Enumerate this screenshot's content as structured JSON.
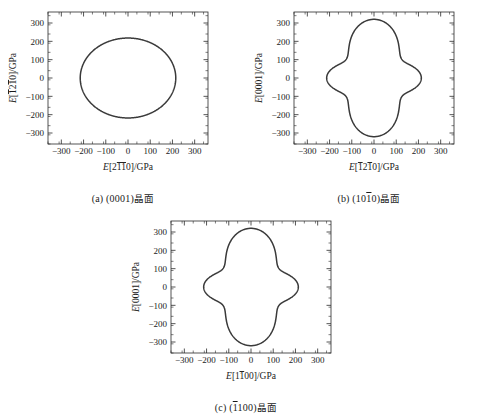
{
  "figure": {
    "panels": [
      {
        "id": "a",
        "caption_prefix": "(a) (0001)",
        "caption_suffix": "晶面",
        "xlabel_parts": [
          {
            "t": "E",
            "italic": true,
            "over": false
          },
          {
            "t": "[2",
            "italic": false,
            "over": false
          },
          {
            "t": "11",
            "italic": false,
            "over": true
          },
          {
            "t": "0]/GPa",
            "italic": false,
            "over": false
          }
        ],
        "ylabel_parts": [
          {
            "t": "E",
            "italic": true,
            "over": false
          },
          {
            "t": "[",
            "italic": false,
            "over": false
          },
          {
            "t": "1",
            "italic": false,
            "over": true
          },
          {
            "t": "2",
            "italic": false,
            "over": false
          },
          {
            "t": "1",
            "italic": false,
            "over": true
          },
          {
            "t": "0]/GPa",
            "italic": false,
            "over": false
          }
        ]
      },
      {
        "id": "b",
        "caption_prefix": "(b) (10",
        "caption_over": "1",
        "caption_mid": "0)",
        "caption_suffix": "晶面",
        "xlabel_parts": [
          {
            "t": "E",
            "italic": true,
            "over": false
          },
          {
            "t": "[",
            "italic": false,
            "over": false
          },
          {
            "t": "1",
            "italic": false,
            "over": true
          },
          {
            "t": "2",
            "italic": false,
            "over": false
          },
          {
            "t": "1",
            "italic": false,
            "over": true
          },
          {
            "t": "0]/GPa",
            "italic": false,
            "over": false
          }
        ],
        "ylabel_parts": [
          {
            "t": "E",
            "italic": true,
            "over": false
          },
          {
            "t": "[0001]/GPa",
            "italic": false,
            "over": false
          }
        ]
      },
      {
        "id": "c",
        "caption_prefix": "(c) (",
        "caption_over": "1",
        "caption_mid": "100)",
        "caption_suffix": "晶面",
        "xlabel_parts": [
          {
            "t": "E",
            "italic": true,
            "over": false
          },
          {
            "t": "[1",
            "italic": false,
            "over": false
          },
          {
            "t": "1",
            "italic": false,
            "over": true
          },
          {
            "t": "00]/GPa",
            "italic": false,
            "over": false
          }
        ],
        "ylabel_parts": [
          {
            "t": "E",
            "italic": true,
            "over": false
          },
          {
            "t": "[0001]/GPa",
            "italic": false,
            "over": false
          }
        ]
      }
    ]
  },
  "axes": {
    "tick_values": [
      -300,
      -200,
      -100,
      0,
      100,
      200,
      300
    ],
    "tick_labels": [
      "−300",
      "−200",
      "−100",
      "0",
      "100",
      "200",
      "300"
    ],
    "xlim": [
      -360,
      360
    ],
    "ylim": [
      -360,
      360
    ],
    "minor_step": 50,
    "grid": false
  },
  "style": {
    "curve_color": "#3a3a3a",
    "frame_color": "#2a2a2a",
    "background": "#ffffff"
  },
  "chart_data": [
    {
      "type": "line",
      "id": "a",
      "title": "(a) (0001)晶面",
      "xlabel": "E[2̱1̱0]/GPa",
      "ylabel": "E[̱1̱2̱1̱0]/GPa",
      "xlim": [
        -360,
        360
      ],
      "ylim": [
        -360,
        360
      ],
      "shape": "ellipse",
      "semi_axis_x": 215,
      "semi_axis_y": 218,
      "modulation_amplitude": 0,
      "modulation_order": 6,
      "description": "Young's modulus polar plot on the (0001) basal plane; nearly isotropic closed ellipse ranging about 215-218 GPa in all directions."
    },
    {
      "type": "line",
      "id": "b",
      "title": "(b) (10̱1̱0)晶面",
      "xlabel": "E[̱1̱2̱1̱0]/GPa",
      "ylabel": "E[0001]/GPa",
      "xlim": [
        -360,
        360
      ],
      "ylim": [
        -360,
        360
      ],
      "shape": "four-lobed",
      "r_vertical": 320,
      "r_horizontal": 213,
      "r_waist_45deg": 168,
      "description": "Young's modulus polar plot on the (10̱1̱0) prismatic plane; four-lobed with maxima ~320 GPa along [0001], ~213 GPa along the in-plane direction, and concave waists ~168 GPa near 45 degrees."
    },
    {
      "type": "line",
      "id": "c",
      "title": "(c) (̱1̱100)晶面",
      "xlabel": "E[1̱1̱00]/GPa",
      "ylabel": "E[0001]/GPa",
      "xlim": [
        -360,
        360
      ],
      "ylim": [
        -360,
        360
      ],
      "shape": "four-lobed",
      "r_vertical": 320,
      "r_horizontal": 213,
      "r_waist_45deg": 168,
      "description": "Young's modulus polar plot on the (̱1̱100) prismatic plane; essentially identical four-lobed profile to panel (b)."
    }
  ]
}
